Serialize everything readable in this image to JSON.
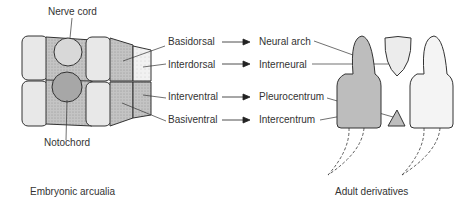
{
  "diagram": {
    "left_panel": {
      "caption": "Embryonic arcualia",
      "labels": {
        "nerve_cord": "Nerve cord",
        "notochord": "Notochord"
      }
    },
    "mapping": [
      {
        "embryonic": "Basidorsal",
        "adult": "Neural arch"
      },
      {
        "embryonic": "Interdorsal",
        "adult": "Interneural"
      },
      {
        "embryonic": "Interventral",
        "adult": "Pleurocentrum"
      },
      {
        "embryonic": "Basiventral",
        "adult": "Intercentrum"
      }
    ],
    "right_panel": {
      "caption": "Adult derivatives"
    },
    "colors": {
      "dark_fill": "#b8b8b8",
      "mid_fill": "#cfcfcf",
      "light_fill": "#ececec",
      "stroke": "#333333"
    }
  }
}
